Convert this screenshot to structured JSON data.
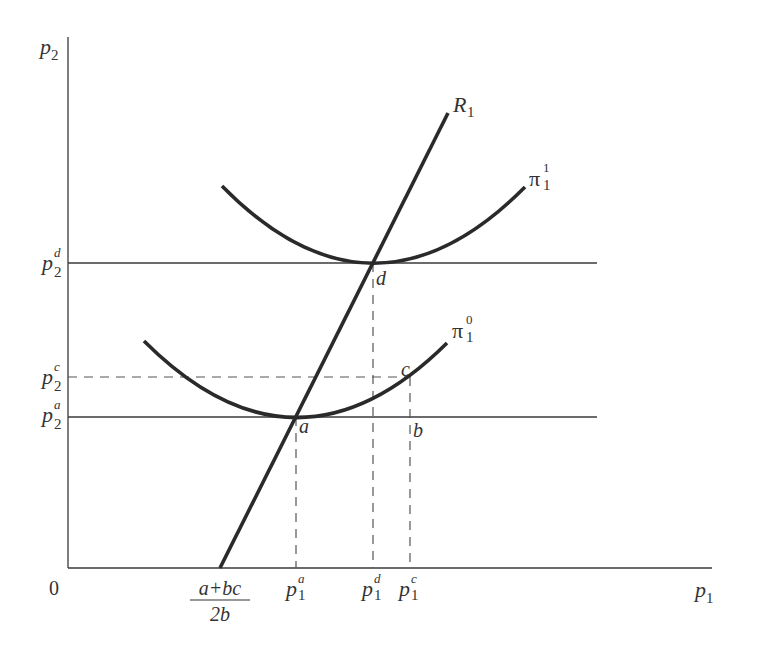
{
  "diagram": {
    "type": "economics-best-response-isoprofit",
    "axes": {
      "origin_label": "0",
      "x_label": {
        "main": "p",
        "sub": "1"
      },
      "y_label": {
        "main": "p",
        "sub": "2"
      }
    },
    "y_ticks": [
      {
        "id": "p2d",
        "main": "p",
        "sub": "2",
        "sup": "d"
      },
      {
        "id": "p2c",
        "main": "p",
        "sub": "2",
        "sup": "c"
      },
      {
        "id": "p2a",
        "main": "p",
        "sub": "2",
        "sup": "a"
      }
    ],
    "x_ticks": [
      {
        "id": "intercept",
        "numerator": "a+bc",
        "denominator": "2b"
      },
      {
        "id": "p1a",
        "main": "p",
        "sub": "1",
        "sup": "a"
      },
      {
        "id": "p1d",
        "main": "p",
        "sub": "1",
        "sup": "d"
      },
      {
        "id": "p1c",
        "main": "p",
        "sub": "1",
        "sup": "c"
      }
    ],
    "curves": {
      "reaction": {
        "main": "R",
        "sub": "1"
      },
      "isoprofit_high": {
        "main": "π",
        "sub": "1",
        "sup": "1"
      },
      "isoprofit_low": {
        "main": "π",
        "sub": "1",
        "sup": "0"
      }
    },
    "points": {
      "a": "a",
      "b": "b",
      "c": "c",
      "d": "d"
    }
  },
  "colors": {
    "line": "#2a2a2a",
    "text": "#333333",
    "background": "#ffffff"
  }
}
